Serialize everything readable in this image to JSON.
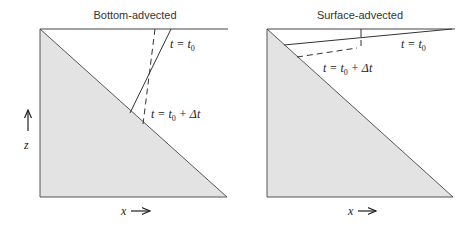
{
  "panels": [
    {
      "title": "Bottom-advected",
      "solid_label": {
        "t": "t = t",
        "sub": "0"
      },
      "dashed_label": {
        "t": "t = t",
        "sub": "0",
        "tail": " + Δt"
      },
      "y_axis_label": "z",
      "x_axis_label": "x"
    },
    {
      "title": "Surface-advected",
      "solid_label": {
        "t": "t = t",
        "sub": "0"
      },
      "dashed_label": {
        "t": "t = t",
        "sub": "0",
        "tail": " + Δt"
      },
      "x_axis_label": "x"
    }
  ],
  "colors": {
    "fill": "#e3e3e3",
    "line": "#333333"
  }
}
